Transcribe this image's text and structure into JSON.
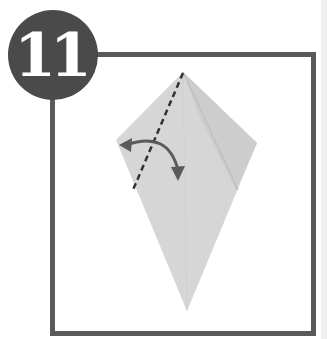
{
  "step": {
    "number": "11"
  },
  "colors": {
    "badge": "#4a4a4a",
    "frame": "#5a5a5a",
    "paper": "#d6d6d6",
    "paper_shade": "#c9c9c9",
    "arrow": "#5a5a5a"
  },
  "diagram": {
    "elements": [
      "kite-shaped-paper",
      "dashed-fold-line",
      "curved-fold-arrow",
      "inner-crease"
    ]
  }
}
